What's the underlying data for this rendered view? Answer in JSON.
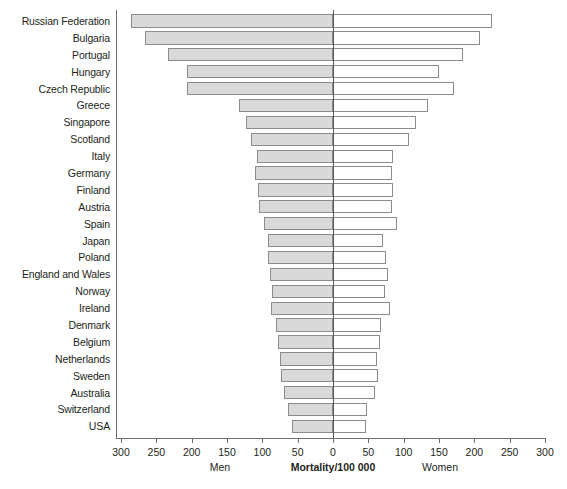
{
  "chart_data": {
    "type": "bar",
    "orientation": "horizontal-diverging",
    "title": "",
    "xlabel": "Mortality/100 000",
    "ylabel": "",
    "xlim": [
      -300,
      300
    ],
    "grid": false,
    "legend_position": "below-axis",
    "axis_tick_labels": [
      "300",
      "250",
      "200",
      "150",
      "100",
      "50",
      "0",
      "50",
      "100",
      "150",
      "200",
      "250",
      "300"
    ],
    "axis_tick_values": [
      -300,
      -250,
      -200,
      -150,
      -100,
      -50,
      0,
      50,
      100,
      150,
      200,
      250,
      300
    ],
    "categories": [
      "Russian Federation",
      "Bulgaria",
      "Portugal",
      "Hungary",
      "Czech Republic",
      "Greece",
      "Singapore",
      "Scotland",
      "Italy",
      "Germany",
      "Finland",
      "Austria",
      "Spain",
      "Japan",
      "Poland",
      "England and Wales",
      "Norway",
      "Ireland",
      "Denmark",
      "Belgium",
      "Netherlands",
      "Sweden",
      "Australia",
      "Switzerland",
      "USA"
    ],
    "series": [
      {
        "name": "Men",
        "side": "left",
        "color": "#d9d9d9",
        "values": [
          286,
          266,
          233,
          206,
          206,
          133,
          123,
          116,
          107,
          110,
          106,
          105,
          98,
          92,
          92,
          89,
          86,
          88,
          81,
          78,
          75,
          74,
          69,
          64,
          58
        ]
      },
      {
        "name": "Women",
        "side": "right",
        "color": "#ffffff",
        "values": [
          225,
          208,
          184,
          150,
          171,
          134,
          117,
          107,
          85,
          84,
          85,
          83,
          90,
          71,
          75,
          78,
          74,
          80,
          68,
          66,
          62,
          63,
          60,
          48,
          47
        ]
      }
    ]
  },
  "captions": {
    "men": "Men",
    "axis_title": "Mortality/100 000",
    "women": "Women"
  },
  "colors": {
    "men_fill": "#d9d9d9",
    "women_fill": "#ffffff",
    "bar_border": "#8c8c8c",
    "axis": "#6f6f6f",
    "text": "#231f20"
  }
}
